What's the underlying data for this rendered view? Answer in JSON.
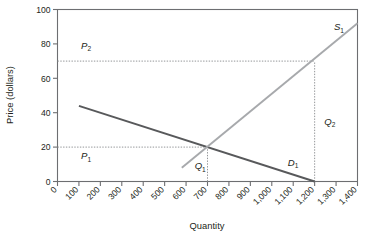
{
  "chart_data": {
    "type": "line",
    "title": "",
    "xlabel": "Quantity",
    "ylabel": "Price (dollars)",
    "xlim": [
      0,
      1400
    ],
    "ylim": [
      0,
      100
    ],
    "grid": false,
    "legend_position": "inline-curve-labels",
    "xticks": [
      0,
      100,
      200,
      300,
      400,
      500,
      600,
      700,
      800,
      900,
      1000,
      1100,
      1200,
      1300,
      1400
    ],
    "xticklabels": [
      "0",
      "100",
      "200",
      "300",
      "400",
      "500",
      "600",
      "700",
      "800",
      "900",
      "1,000",
      "1,100",
      "1,200",
      "1,300",
      "1,400"
    ],
    "yticks": [
      0,
      20,
      40,
      60,
      80,
      100
    ],
    "yticklabels": [
      "0",
      "20",
      "40",
      "60",
      "80",
      "100"
    ],
    "series": [
      {
        "name": "D1",
        "label": "D",
        "label_sub": "1",
        "color": "#58595b",
        "points": [
          [
            100,
            44
          ],
          [
            1200,
            0
          ]
        ]
      },
      {
        "name": "S1",
        "label": "S",
        "label_sub": "1",
        "color": "#a7a9ac",
        "points": [
          [
            580,
            8
          ],
          [
            1400,
            92
          ]
        ]
      }
    ],
    "annotations": [
      {
        "name": "P1",
        "label": "P",
        "label_sub": "1",
        "x": 110,
        "y": 13
      },
      {
        "name": "P2",
        "label": "P",
        "label_sub": "2",
        "x": 110,
        "y": 77
      },
      {
        "name": "Q1",
        "label": "Q",
        "label_sub": "1",
        "x": 640,
        "y": 7
      },
      {
        "name": "Q2",
        "label": "Q",
        "label_sub": "2",
        "x": 1245,
        "y": 33
      }
    ],
    "reference_lines": [
      {
        "name": "p1-horizontal",
        "orientation": "horizontal",
        "value": 20,
        "from": 0,
        "to": 700
      },
      {
        "name": "p2-horizontal",
        "orientation": "horizontal",
        "value": 70,
        "from": 0,
        "to": 1200
      },
      {
        "name": "q1-vertical",
        "orientation": "vertical",
        "value": 700,
        "from": 0,
        "to": 20
      },
      {
        "name": "q2-vertical",
        "orientation": "vertical",
        "value": 1200,
        "from": 0,
        "to": 70
      }
    ],
    "equilibrium": {
      "quantity": 700,
      "price": 20
    },
    "second_point": {
      "quantity": 1200,
      "price": 70
    }
  },
  "style": {
    "demand_color": "#58595b",
    "supply_color": "#a7a9ac",
    "axis_color": "#6d6e71",
    "dotted_color": "#939598",
    "background": "#ffffff"
  }
}
